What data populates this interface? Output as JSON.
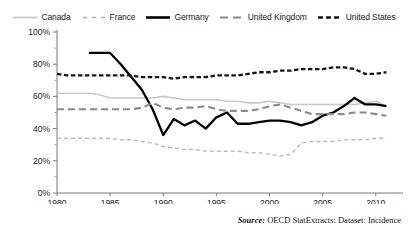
{
  "chart_data": {
    "type": "line",
    "title": "",
    "xlabel": "",
    "ylabel": "",
    "xlim": [
      1980,
      2012
    ],
    "ylim": [
      0,
      100
    ],
    "y_tick_labels": [
      "100%",
      "80%",
      "60%",
      "40%",
      "20%",
      "0%"
    ],
    "y_ticks": [
      100,
      80,
      60,
      40,
      20,
      0
    ],
    "y_minor_ticks": [
      90,
      70,
      50,
      30,
      10
    ],
    "x_tick_labels": [
      "1980",
      "1985",
      "1990",
      "1995",
      "2000",
      "2005",
      "2010"
    ],
    "x_ticks": [
      1980,
      1985,
      1990,
      1995,
      2000,
      2005,
      2010
    ],
    "grid": false,
    "legend_position": "top-center",
    "series": [
      {
        "name": "Canada",
        "color": "#c9c9c9",
        "style": "solid",
        "x": [
          1980,
          1981,
          1982,
          1983,
          1984,
          1985,
          1986,
          1987,
          1988,
          1989,
          1990,
          1991,
          1992,
          1993,
          1994,
          1995,
          1996,
          1997,
          1998,
          1999,
          2000,
          2001,
          2002,
          2003,
          2004,
          2005,
          2006,
          2007,
          2008,
          2009,
          2010,
          2011
        ],
        "values": [
          62,
          62,
          62,
          62,
          61,
          59,
          59,
          59,
          59,
          59,
          60,
          59,
          58,
          58,
          58,
          58,
          57,
          57,
          56,
          56,
          57,
          56,
          55,
          55,
          55,
          55,
          55,
          55,
          55,
          56,
          57,
          54
        ]
      },
      {
        "name": "France",
        "color": "#bdbdbd",
        "style": "dashed-fine",
        "x": [
          1980,
          1981,
          1982,
          1983,
          1984,
          1985,
          1986,
          1987,
          1988,
          1989,
          1990,
          1991,
          1992,
          1993,
          1994,
          1995,
          1996,
          1997,
          1998,
          1999,
          2000,
          2001,
          2002,
          2003,
          2004,
          2005,
          2006,
          2007,
          2008,
          2009,
          2010,
          2011
        ],
        "values": [
          34,
          34,
          34,
          34,
          34,
          34,
          33,
          33,
          32,
          31,
          29,
          28,
          27,
          27,
          26,
          26,
          26,
          26,
          25,
          25,
          24,
          23,
          24,
          31,
          32,
          32,
          32,
          33,
          33,
          33,
          34,
          34
        ]
      },
      {
        "name": "Germany",
        "color": "#000000",
        "style": "solid-heavy",
        "x": [
          1983,
          1984,
          1985,
          1986,
          1987,
          1988,
          1989,
          1990,
          1991,
          1992,
          1993,
          1994,
          1995,
          1996,
          1997,
          1998,
          1999,
          2000,
          2001,
          2002,
          2003,
          2004,
          2005,
          2006,
          2007,
          2008,
          2009,
          2010,
          2011
        ],
        "values": [
          87,
          87,
          87,
          80,
          72,
          64,
          52,
          36,
          46,
          42,
          45,
          40,
          47,
          50,
          43,
          43,
          44,
          45,
          45,
          44,
          42,
          44,
          48,
          50,
          54,
          59,
          55,
          55,
          54
        ]
      },
      {
        "name": "United Kingdom",
        "color": "#8a8a8a",
        "style": "dashed-long",
        "x": [
          1980,
          1981,
          1982,
          1983,
          1984,
          1985,
          1986,
          1987,
          1988,
          1989,
          1990,
          1991,
          1992,
          1993,
          1994,
          1995,
          1996,
          1997,
          1998,
          1999,
          2000,
          2001,
          2002,
          2003,
          2004,
          2005,
          2006,
          2007,
          2008,
          2009,
          2010,
          2011
        ],
        "values": [
          52,
          52,
          52,
          52,
          52,
          52,
          52,
          52,
          53,
          56,
          53,
          52,
          53,
          53,
          54,
          52,
          51,
          51,
          51,
          52,
          54,
          55,
          53,
          51,
          49,
          49,
          49,
          49,
          50,
          50,
          49,
          48
        ]
      },
      {
        "name": "United States",
        "color": "#161616",
        "style": "dashed-bold",
        "x": [
          1980,
          1981,
          1982,
          1983,
          1984,
          1985,
          1986,
          1987,
          1988,
          1989,
          1990,
          1991,
          1992,
          1993,
          1994,
          1995,
          1996,
          1997,
          1998,
          1999,
          2000,
          2001,
          2002,
          2003,
          2004,
          2005,
          2006,
          2007,
          2008,
          2009,
          2010,
          2011
        ],
        "values": [
          74,
          73,
          73,
          73,
          73,
          73,
          73,
          73,
          72,
          72,
          72,
          71,
          72,
          72,
          72,
          73,
          73,
          73,
          74,
          75,
          75,
          76,
          76,
          77,
          77,
          77,
          78,
          78,
          77,
          74,
          74,
          75
        ]
      }
    ]
  },
  "legend": {
    "items": [
      {
        "label": "Canada",
        "key": "canada"
      },
      {
        "label": "France",
        "key": "france"
      },
      {
        "label": "Germany",
        "key": "germany"
      },
      {
        "label": "United Kingdom",
        "key": "united-kingdom"
      },
      {
        "label": "United States",
        "key": "united-states"
      }
    ]
  },
  "source": {
    "lead": "Source:",
    "text": " OECD StatExtracts: Dataset: Incidence"
  }
}
